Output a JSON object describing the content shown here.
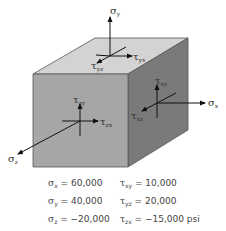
{
  "diagram": {
    "type": "stress-element-cube",
    "colors": {
      "top_face": "#d3d3d3",
      "front_face": "#a6a6a6",
      "right_face": "#7a7a7a",
      "edge": "#555555",
      "arrow": "#111111",
      "label": "#333333"
    },
    "labels": {
      "sigma_y": "σ",
      "sigma_y_sub": "y",
      "tau_yx": "τ",
      "tau_yx_sub": "yx",
      "tau_yz": "τ",
      "tau_yz_sub": "yz",
      "tau_xy": "τ",
      "tau_xy_sub": "xy",
      "sigma_x": "σ",
      "sigma_x_sub": "x",
      "tau_xz": "τ",
      "tau_xz_sub": "xz",
      "tau_zy": "τ",
      "tau_zy_sub": "zy",
      "tau_zx": "τ",
      "tau_zx_sub": "zx",
      "sigma_z": "σ",
      "sigma_z_sub": "z"
    }
  },
  "values": {
    "rows": [
      {
        "left_sym": "σ",
        "left_sub": "x",
        "left_val": " = 60,000",
        "right_sym": "τ",
        "right_sub": "xy",
        "right_val": " = 10,000"
      },
      {
        "left_sym": "σ",
        "left_sub": "y",
        "left_val": " = 40,000",
        "right_sym": "τ",
        "right_sub": "yz",
        "right_val": " = 20,000"
      },
      {
        "left_sym": "σ",
        "left_sub": "z",
        "left_val": " = −20,000",
        "right_sym": "τ",
        "right_sub": "zx",
        "right_val": " = −15,000 psi"
      }
    ]
  }
}
